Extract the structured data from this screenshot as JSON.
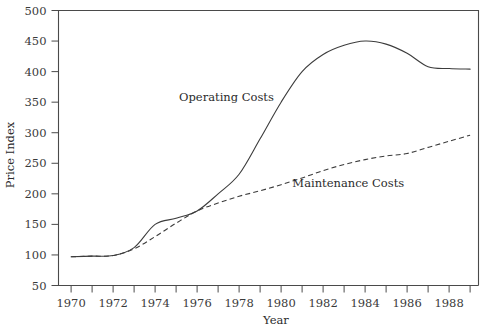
{
  "chart_data": {
    "type": "line",
    "title": "",
    "xlabel": "Year",
    "ylabel": "Price Index",
    "xlim": [
      1969.4,
      1989.4
    ],
    "ylim": [
      50,
      500
    ],
    "grid": false,
    "legend_position": "inline-annotation",
    "x_ticks_labeled": [
      "1970",
      "1972",
      "1974",
      "1976",
      "1978",
      "1980",
      "1982",
      "1984",
      "1986",
      "1988"
    ],
    "x_ticks_labeled_values": [
      1970,
      1972,
      1974,
      1976,
      1978,
      1980,
      1982,
      1984,
      1986,
      1988
    ],
    "x_ticks_minor_values": [
      1971,
      1973,
      1975,
      1977,
      1979,
      1981,
      1983,
      1985,
      1987,
      1989
    ],
    "y_ticks": [
      "50",
      "100",
      "150",
      "200",
      "250",
      "300",
      "350",
      "400",
      "450",
      "500"
    ],
    "y_tick_values": [
      50,
      100,
      150,
      200,
      250,
      300,
      350,
      400,
      450,
      500
    ],
    "x": [
      1970,
      1971,
      1972,
      1973,
      1974,
      1975,
      1976,
      1977,
      1978,
      1979,
      1980,
      1981,
      1982,
      1983,
      1984,
      1985,
      1986,
      1987,
      1988,
      1989
    ],
    "series": [
      {
        "name": "Operating Costs",
        "style": "solid",
        "label_x": 1977.4,
        "label_y": 352,
        "values": [
          97,
          98,
          99,
          112,
          150,
          160,
          172,
          200,
          232,
          290,
          350,
          400,
          428,
          443,
          450,
          445,
          430,
          408,
          405,
          404
        ]
      },
      {
        "name": "Maintenance Costs",
        "style": "dashed",
        "label_x": 1983.2,
        "label_y": 212,
        "values": [
          97,
          98,
          99,
          110,
          130,
          152,
          172,
          185,
          196,
          205,
          215,
          226,
          238,
          248,
          256,
          262,
          266,
          276,
          286,
          296
        ]
      }
    ]
  }
}
